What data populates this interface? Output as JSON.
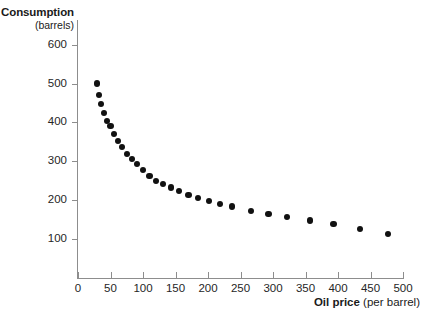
{
  "chart_data": {
    "type": "scatter",
    "title": "",
    "xlabel": "Oil price (per barrel)",
    "xlabel_bold_part": "Oil price",
    "xlabel_plain_part": "(per barrel)",
    "ylabel": "Consumption (barrels)",
    "ylabel_bold_part": "Consumption",
    "ylabel_plain_part": "(barrels)",
    "xlim": [
      0,
      500
    ],
    "ylim": [
      0,
      650
    ],
    "grid": false,
    "legend": null,
    "xticks": [
      0,
      50,
      100,
      150,
      200,
      250,
      300,
      350,
      400,
      450,
      500
    ],
    "yticks": [
      100,
      200,
      300,
      400,
      500,
      600
    ],
    "marker_color": "#111111",
    "axis_color": "#8d8d8d",
    "x": [
      29,
      32,
      36,
      40,
      45,
      50,
      56,
      62,
      68,
      75,
      83,
      91,
      100,
      110,
      120,
      131,
      143,
      156,
      170,
      185,
      201,
      218,
      237,
      266,
      293,
      322,
      357,
      393,
      434,
      477
    ],
    "y": [
      500,
      470,
      448,
      425,
      403,
      390,
      370,
      352,
      336,
      318,
      305,
      292,
      278,
      262,
      248,
      240,
      232,
      222,
      212,
      204,
      198,
      190,
      183,
      172,
      163,
      155,
      147,
      138,
      126,
      113
    ],
    "series": [
      {
        "name": "Oil consumption vs price",
        "points": [
          [
            29,
            500
          ],
          [
            32,
            470
          ],
          [
            36,
            448
          ],
          [
            40,
            425
          ],
          [
            45,
            403
          ],
          [
            50,
            390
          ],
          [
            56,
            370
          ],
          [
            62,
            352
          ],
          [
            68,
            336
          ],
          [
            75,
            318
          ],
          [
            83,
            305
          ],
          [
            91,
            292
          ],
          [
            100,
            278
          ],
          [
            110,
            262
          ],
          [
            120,
            248
          ],
          [
            131,
            240
          ],
          [
            143,
            232
          ],
          [
            156,
            222
          ],
          [
            170,
            212
          ],
          [
            185,
            204
          ],
          [
            201,
            198
          ],
          [
            218,
            190
          ],
          [
            237,
            183
          ],
          [
            266,
            172
          ],
          [
            293,
            163
          ],
          [
            322,
            155
          ],
          [
            357,
            147
          ],
          [
            393,
            138
          ],
          [
            434,
            126
          ],
          [
            477,
            113
          ]
        ]
      }
    ]
  }
}
